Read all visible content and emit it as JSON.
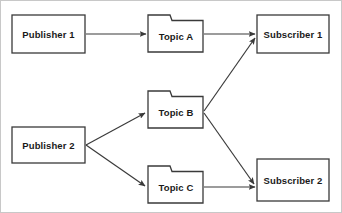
{
  "diagram": {
    "canvas": {
      "width": 342,
      "height": 213,
      "background": "#ffffff",
      "border_color": "#c8c8c8"
    },
    "style": {
      "stroke_color": "#3a3a3a",
      "fill_color": "#ffffff",
      "text_color": "#1a1a1a"
    },
    "nodes": [
      {
        "id": "publisher-1",
        "label": "Publisher 1",
        "shape": "rectangle",
        "x": 11,
        "y": 14,
        "width": 73,
        "height": 38
      },
      {
        "id": "publisher-2",
        "label": "Publisher 2",
        "shape": "rectangle",
        "x": 11,
        "y": 126,
        "width": 73,
        "height": 36
      },
      {
        "id": "topic-a",
        "label": "Topic A",
        "shape": "folder",
        "x": 147,
        "y": 14,
        "width": 55,
        "height": 37
      },
      {
        "id": "topic-b",
        "label": "Topic B",
        "shape": "folder",
        "x": 147,
        "y": 90,
        "width": 55,
        "height": 37
      },
      {
        "id": "topic-c",
        "label": "Topic C",
        "shape": "folder",
        "x": 147,
        "y": 165,
        "width": 55,
        "height": 37
      },
      {
        "id": "subscriber-1",
        "label": "Subscriber 1",
        "shape": "rectangle",
        "x": 256,
        "y": 14,
        "width": 72,
        "height": 38
      },
      {
        "id": "subscriber-2",
        "label": "Subscriber 2",
        "shape": "rectangle",
        "x": 256,
        "y": 158,
        "width": 72,
        "height": 42
      }
    ],
    "edges": [
      {
        "id": "edge-publisher1-topica",
        "from": "publisher-1",
        "to": "topic-a",
        "type": "arrow",
        "orientation": "horizontal"
      },
      {
        "id": "edge-topica-subscriber1",
        "from": "topic-a",
        "to": "subscriber-1",
        "type": "arrow",
        "orientation": "horizontal"
      },
      {
        "id": "edge-publisher2-topicb",
        "from": "publisher-2",
        "to": "topic-b",
        "type": "arrow",
        "orientation": "diagonal-up"
      },
      {
        "id": "edge-publisher2-topicc",
        "from": "publisher-2",
        "to": "topic-c",
        "type": "arrow",
        "orientation": "diagonal-down"
      },
      {
        "id": "edge-topicb-subscriber1",
        "from": "topic-b",
        "to": "subscriber-1",
        "type": "arrow",
        "orientation": "diagonal-up"
      },
      {
        "id": "edge-topicb-subscriber2",
        "from": "topic-b",
        "to": "subscriber-2",
        "type": "arrow",
        "orientation": "diagonal-down"
      },
      {
        "id": "edge-topicc-subscriber2",
        "from": "topic-c",
        "to": "subscriber-2",
        "type": "arrow",
        "orientation": "horizontal"
      }
    ]
  }
}
